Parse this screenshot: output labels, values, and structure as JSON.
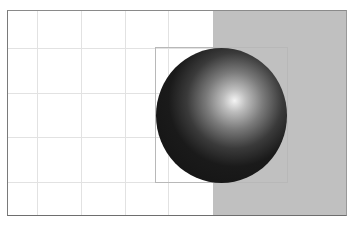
{
  "canvas": {
    "background": "#ffffff",
    "panel_color": "#c0c0c0",
    "grid_color": "#e2e2e2",
    "grid_x": [
      29,
      73,
      117,
      160
    ],
    "grid_y": [
      38,
      83,
      127,
      172
    ]
  },
  "object": {
    "type": "sphere",
    "fill_dark": "#151515",
    "highlight": "#f0f0f0",
    "selected": true
  }
}
